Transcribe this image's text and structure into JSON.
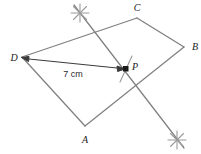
{
  "figure": {
    "stroke_color": "#808080",
    "label_color": "#1a1a1a",
    "background_color": "#ffffff",
    "labels": {
      "a": "A",
      "b": "B",
      "c": "C",
      "d": "D",
      "p": "P",
      "measure": "7 cm"
    },
    "vertices": {
      "A": {
        "x": 85,
        "y": 126
      },
      "B": {
        "x": 184,
        "y": 47
      },
      "C": {
        "x": 137,
        "y": 18
      },
      "D": {
        "x": 22,
        "y": 57
      },
      "P": {
        "x": 126,
        "y": 69
      }
    },
    "label_positions": {
      "A": {
        "x": 85,
        "y": 141
      },
      "B": {
        "x": 194,
        "y": 48
      },
      "C": {
        "x": 137,
        "y": 10
      },
      "D": {
        "x": 11,
        "y": 58
      },
      "P": {
        "x": 134,
        "y": 68
      },
      "measure": {
        "x": 72,
        "y": 75
      }
    },
    "edges": [
      {
        "name": "side-DC",
        "from": "D",
        "to": "C"
      },
      {
        "name": "side-CB",
        "from": "C",
        "to": "B"
      },
      {
        "name": "side-BA",
        "from": "B",
        "to": "A"
      },
      {
        "name": "side-AD",
        "from": "A",
        "to": "D"
      }
    ],
    "construction_line": {
      "name": "perpendicular-bisector",
      "from": {
        "x": 74,
        "y": 5
      },
      "to": {
        "x": 184,
        "y": 148
      }
    },
    "arc_marks": [
      {
        "name": "arc-cross-top",
        "x": 80,
        "y": 13
      },
      {
        "name": "arc-cross-bottom",
        "x": 177,
        "y": 140
      }
    ],
    "tick_mark": {
      "name": "tick-at-P",
      "x": 126,
      "y": 69
    },
    "measure_arrow": {
      "name": "measure-arrow-D-to-P",
      "from": {
        "x": 24,
        "y": 59
      },
      "to": {
        "x": 124,
        "y": 69
      }
    }
  }
}
